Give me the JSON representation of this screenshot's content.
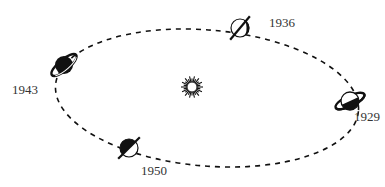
{
  "diagram": {
    "title": "",
    "center": {
      "name": "Sun",
      "x": 192,
      "y": 87
    },
    "orbit": {
      "cx": 207,
      "cy": 98,
      "rx": 152,
      "ry": 68,
      "rotate": 5,
      "style": "dashed"
    },
    "colors": {
      "ink": "#111111",
      "label": "#333333",
      "background": "#ffffff"
    },
    "positions": [
      {
        "year": "1929",
        "x": 350,
        "y": 101,
        "label_x": 354,
        "label_y": 121,
        "kind": "ringed",
        "ring_angle": -25
      },
      {
        "year": "1936",
        "x": 240,
        "y": 28,
        "label_x": 269,
        "label_y": 27,
        "kind": "edge-on",
        "ring_angle": -50
      },
      {
        "year": "1943",
        "x": 64,
        "y": 65,
        "label_x": 12,
        "label_y": 94,
        "kind": "ringed",
        "ring_angle": -40
      },
      {
        "year": "1950",
        "x": 129,
        "y": 148,
        "label_x": 141,
        "label_y": 175,
        "kind": "edge-on",
        "ring_angle": -45
      }
    ]
  }
}
